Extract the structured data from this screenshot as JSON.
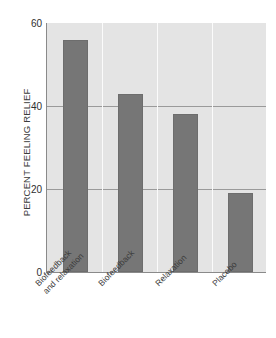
{
  "chart_data": {
    "type": "bar",
    "title": "",
    "subtitle": "",
    "xlabel": "",
    "ylabel": "PERCENT FEELING RELIEF",
    "categories": [
      "Biofeedback and relaxation",
      "Biofeedback",
      "Relaxation",
      "Placebo"
    ],
    "category_lines": [
      [
        "Biofeedback",
        "and relaxation"
      ],
      [
        "Biofeedback"
      ],
      [
        "Relaxation"
      ],
      [
        "Placebo"
      ]
    ],
    "values": [
      56,
      43,
      38,
      19
    ],
    "ylim": [
      0,
      60
    ],
    "yticks": [
      0,
      20,
      40,
      60
    ],
    "ytick_labels": [
      "0",
      "20",
      "40",
      "60"
    ],
    "grid": "horizontal",
    "legend": "none",
    "colors": {
      "bar": "#767676",
      "bar_border": "#6d6d6d",
      "plot_background": "#e4e4e4",
      "gridline": "#9a9a9a",
      "axis_line": "#8a8a8a",
      "band_separator": "#fbfbfb",
      "text": "#3b3b3b",
      "page_background": "#ffffff"
    }
  },
  "axis": {
    "y_title": "PERCENT FEELING RELIEF"
  },
  "artifact": {
    "top_fragment": ""
  }
}
